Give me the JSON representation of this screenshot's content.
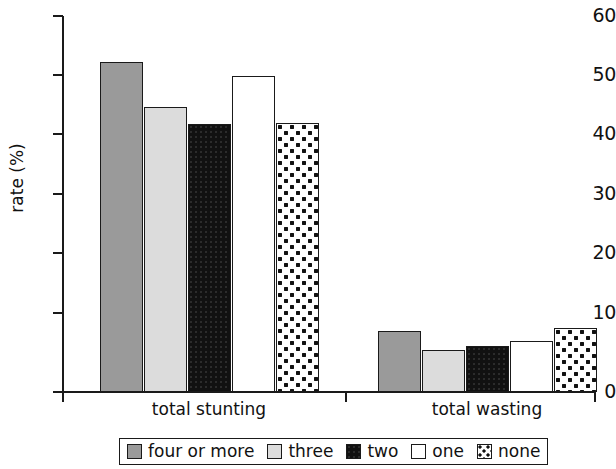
{
  "chart_data": {
    "type": "bar",
    "title": "",
    "xlabel": "",
    "ylabel": "rate (%)",
    "categories": [
      "total stunting",
      "total wasting"
    ],
    "series": [
      {
        "name": "four or more",
        "pattern": "gray",
        "values": [
          52.6,
          9.8
        ]
      },
      {
        "name": "three",
        "pattern": "lightgray",
        "values": [
          45.5,
          6.7
        ]
      },
      {
        "name": "two",
        "pattern": "black",
        "values": [
          42.7,
          7.4
        ]
      },
      {
        "name": "one",
        "pattern": "white",
        "values": [
          50.4,
          8.2
        ]
      },
      {
        "name": "none",
        "pattern": "checker",
        "values": [
          43.0,
          10.2
        ]
      }
    ],
    "ylim": [
      0,
      60
    ],
    "yticks": [
      0,
      10,
      20,
      30,
      40,
      50,
      60
    ],
    "ytick_labels": [
      "0",
      "10",
      "20",
      "30",
      "40",
      "50",
      "60"
    ],
    "grid": false,
    "legend_position": "bottom"
  },
  "axes": {
    "y_label": "rate (%)",
    "tick_0": "0",
    "tick_10": "10",
    "tick_20": "20",
    "tick_30": "30",
    "tick_40": "40",
    "tick_50": "50",
    "tick_60": "60",
    "x_label_1": "total stunting",
    "x_label_2": "total wasting"
  },
  "legend": {
    "items": [
      {
        "label": "four or more"
      },
      {
        "label": "three"
      },
      {
        "label": "two"
      },
      {
        "label": "one"
      },
      {
        "label": "none"
      }
    ]
  }
}
